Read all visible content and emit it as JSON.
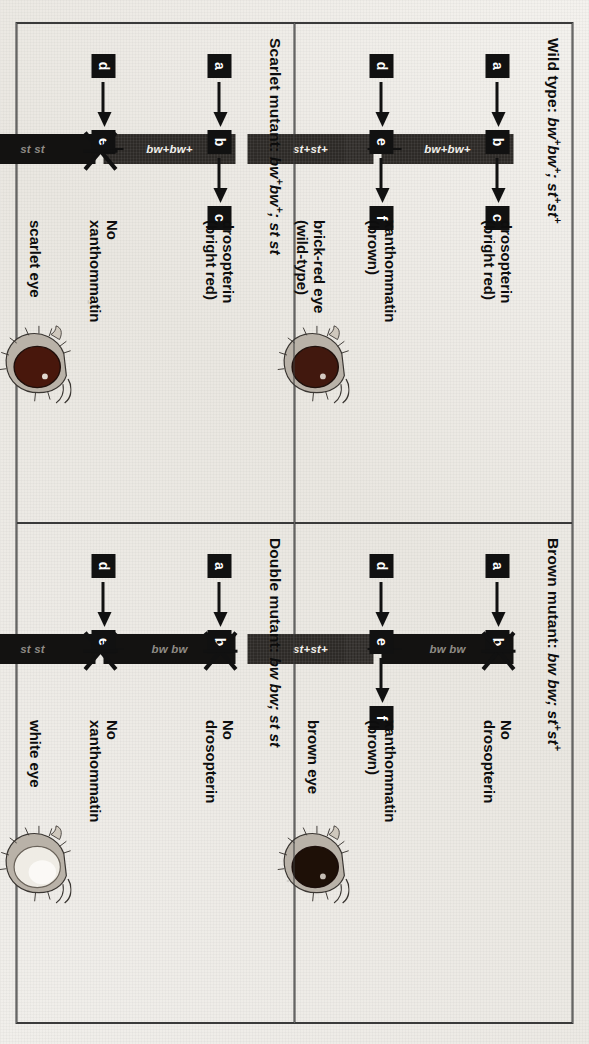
{
  "figure": {
    "kind": "textbook-figure-scan",
    "orientation": "rotated-90-clockwise",
    "background_color": "#eceae5",
    "ink_color": "#111111"
  },
  "panels": [
    {
      "id": "wild-type",
      "title_prefix": "Wild type: ",
      "genotype_bw": "bw",
      "genotype_bw_sup": "+",
      "genotype_bw2": "bw",
      "genotype_bw2_sup": "+",
      "genotype_sep": "; ",
      "genotype_st": "st",
      "genotype_st_sup": "+",
      "genotype_st2": "st",
      "genotype_st2_sup": "+",
      "title_full": "Wild type: bw+bw+; st+st+",
      "top_pathway": {
        "nodes": [
          "a",
          "b",
          "c"
        ],
        "gene_bar_label": "bw+bw+",
        "blocked": false,
        "product": "drosopterin",
        "product_note": "(bright red)"
      },
      "bottom_pathway": {
        "nodes": [
          "d",
          "e",
          "f"
        ],
        "gene_bar_label": "st+st+",
        "blocked": false,
        "product": "xanthommatin",
        "product_note": "(brown)"
      },
      "phenotype_label_line1": "brick-red eye",
      "phenotype_label_line2": "(wild-type)",
      "eye_color": "#8e2f18",
      "eye_icon": "fly-head-icon"
    },
    {
      "id": "scarlet-mutant",
      "title_prefix": "Scarlet mutant: ",
      "title_full": "Scarlet mutant: bw+bw+; st st",
      "top_pathway": {
        "nodes": [
          "a",
          "b",
          "c"
        ],
        "gene_bar_label": "bw+bw+",
        "blocked": false,
        "product": "drosopterin",
        "product_note": "(bright red)"
      },
      "bottom_pathway": {
        "nodes": [
          "d",
          "e"
        ],
        "gene_bar_label": "st st",
        "blocked": true,
        "product_line1": "No",
        "product_line2": "xanthommatin"
      },
      "phenotype_label_line1": "scarlet eye",
      "phenotype_label_line2": "",
      "eye_color": "#c0371c",
      "eye_icon": "fly-head-icon"
    },
    {
      "id": "brown-mutant",
      "title_prefix": "Brown mutant: ",
      "title_full": "Brown mutant: bw bw; st+st+",
      "top_pathway": {
        "nodes": [
          "a",
          "b"
        ],
        "gene_bar_label": "bw bw",
        "blocked": true,
        "product_line1": "No",
        "product_line2": "drosopterin"
      },
      "bottom_pathway": {
        "nodes": [
          "d",
          "e",
          "f"
        ],
        "gene_bar_label": "st+st+",
        "blocked": false,
        "product": "xanthommatin",
        "product_note": "(brown)"
      },
      "phenotype_label_line1": "brown eye",
      "phenotype_label_line2": "",
      "eye_color": "#4a2a12",
      "eye_icon": "fly-head-icon"
    },
    {
      "id": "double-mutant",
      "title_prefix": "Double mutant: ",
      "title_full": "Double mutant: bw bw; st st",
      "top_pathway": {
        "nodes": [
          "a",
          "b"
        ],
        "gene_bar_label": "bw bw",
        "blocked": true,
        "product_line1": "No",
        "product_line2": "drosopterin"
      },
      "bottom_pathway": {
        "nodes": [
          "d",
          "e"
        ],
        "gene_bar_label": "st st",
        "blocked": true,
        "product_line1": "No",
        "product_line2": "xanthommatin"
      },
      "phenotype_label_line1": "white eye",
      "phenotype_label_line2": "",
      "eye_color": "#e8e4dc",
      "eye_icon": "fly-head-icon"
    }
  ]
}
